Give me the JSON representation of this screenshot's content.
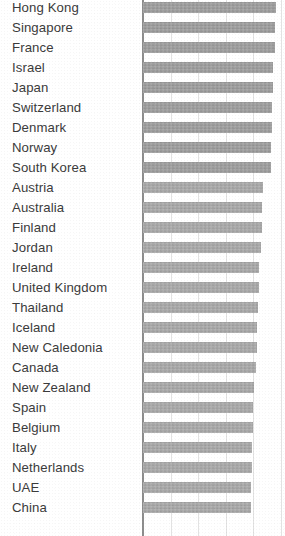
{
  "chart_data": {
    "type": "bar",
    "orientation": "horizontal",
    "title": "",
    "subtitle": "",
    "xlabel": "",
    "ylabel": "",
    "grid": true,
    "legend": false,
    "xlim": [
      0,
      5
    ],
    "gridline_values": [
      0,
      1,
      2,
      3,
      4,
      5
    ],
    "categories": [
      "Hong Kong",
      "Singapore",
      "France",
      "Israel",
      "Japan",
      "Switzerland",
      "Denmark",
      "Norway",
      "South Korea",
      "Austria",
      "Australia",
      "Finland",
      "Jordan",
      "Ireland",
      "United Kingdom",
      "Thailand",
      "Iceland",
      "New Caledonia",
      "Canada",
      "New Zealand",
      "Spain",
      "Belgium",
      "Italy",
      "Netherlands",
      "UAE",
      "China"
    ],
    "values": [
      4.82,
      4.8,
      4.78,
      4.72,
      4.7,
      4.68,
      4.66,
      4.64,
      4.62,
      4.34,
      4.32,
      4.3,
      4.26,
      4.22,
      4.2,
      4.18,
      4.14,
      4.12,
      4.08,
      4.02,
      4.0,
      3.98,
      3.96,
      3.94,
      3.92,
      3.9
    ],
    "bar_color": "#a6a6a6",
    "axis_color": "#8d8d8d",
    "grid_color": "#e2e2e2",
    "label_color": "#3b3b3b"
  }
}
